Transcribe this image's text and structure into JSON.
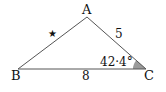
{
  "diagram": {
    "type": "triangle",
    "vertices": {
      "A": {
        "label": "A"
      },
      "B": {
        "label": "B"
      },
      "C": {
        "label": "C"
      }
    },
    "sides": {
      "AC": {
        "label": "5"
      },
      "BC": {
        "label": "8"
      },
      "AB": {
        "label": "★",
        "meaning": "unknown"
      }
    },
    "angle_C": {
      "label": "42·4°",
      "shade_color": "#9a9a9a"
    },
    "line_color": "#555555"
  }
}
